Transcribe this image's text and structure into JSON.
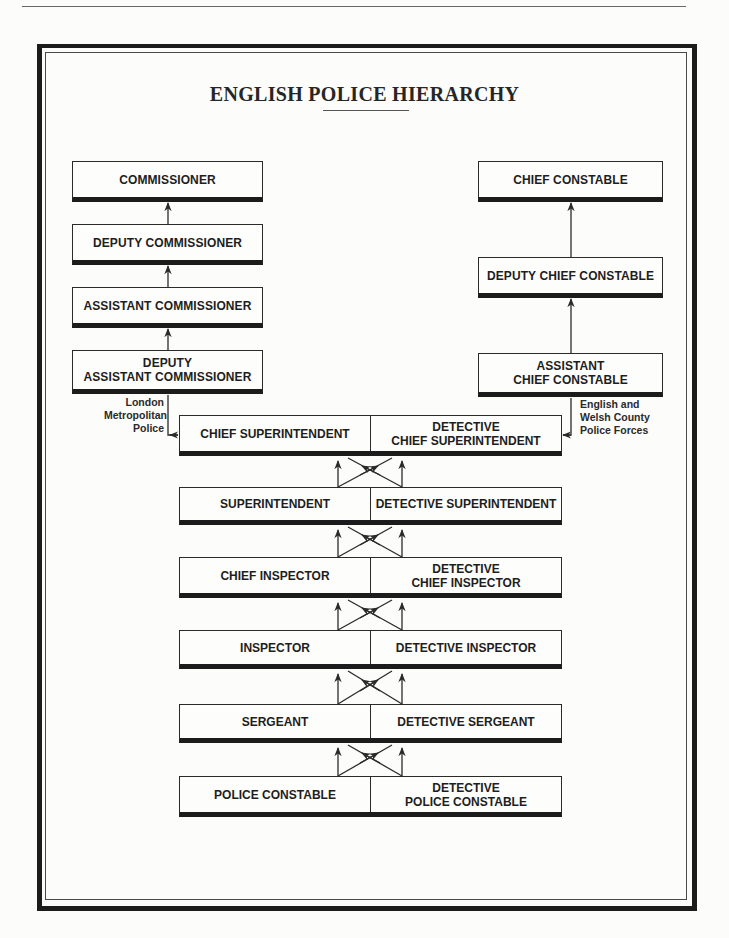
{
  "diagram": {
    "title": "ENGLISH POLICE HIERARCHY",
    "london_metropolitan": {
      "label": "London Metropolitan Police",
      "label_lines": [
        "London",
        "Metropolitan",
        "Police"
      ],
      "ranks": [
        {
          "label": "COMMISSIONER"
        },
        {
          "label": "DEPUTY COMMISSIONER"
        },
        {
          "label": "ASSISTANT COMMISSIONER"
        },
        {
          "label_lines": [
            "DEPUTY",
            "ASSISTANT COMMISSIONER"
          ]
        }
      ]
    },
    "county_forces": {
      "label": "English and Welsh County Police Forces",
      "label_lines": [
        "English and",
        "Welsh County",
        "Police Forces"
      ],
      "ranks": [
        {
          "label": "CHIEF CONSTABLE"
        },
        {
          "label": "DEPUTY CHIEF CONSTABLE"
        },
        {
          "label_lines": [
            "ASSISTANT",
            "CHIEF CONSTABLE"
          ]
        }
      ]
    },
    "shared_ranks": [
      {
        "uniformed": [
          "CHIEF SUPERINTENDENT"
        ],
        "detective": [
          "DETECTIVE",
          "CHIEF SUPERINTENDENT"
        ]
      },
      {
        "uniformed": [
          "SUPERINTENDENT"
        ],
        "detective": [
          "DETECTIVE SUPERINTENDENT"
        ]
      },
      {
        "uniformed": [
          "CHIEF INSPECTOR"
        ],
        "detective": [
          "DETECTIVE",
          "CHIEF INSPECTOR"
        ]
      },
      {
        "uniformed": [
          "INSPECTOR"
        ],
        "detective": [
          "DETECTIVE INSPECTOR"
        ]
      },
      {
        "uniformed": [
          "SERGEANT"
        ],
        "detective": [
          "DETECTIVE SERGEANT"
        ]
      },
      {
        "uniformed": [
          "POLICE CONSTABLE"
        ],
        "detective": [
          "DETECTIVE",
          "POLICE CONSTABLE"
        ]
      }
    ]
  }
}
